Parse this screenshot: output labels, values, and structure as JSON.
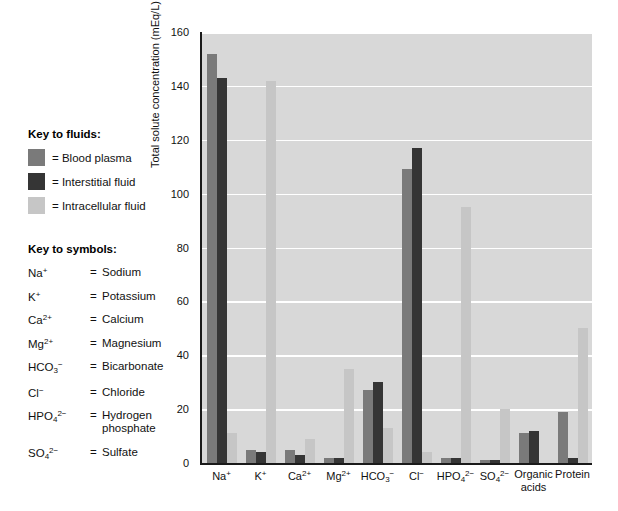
{
  "key_fluids": {
    "title": "Key to fluids:",
    "items": [
      {
        "label": "= Blood plasma",
        "color": "#7a7a7a"
      },
      {
        "label": "= Interstitial fluid",
        "color": "#353535"
      },
      {
        "label": "= Intracellular fluid",
        "color": "#c6c6c6"
      }
    ]
  },
  "key_symbols": {
    "title": "Key to symbols:",
    "items": [
      {
        "formula_html": "Na<sup>+</sup>",
        "eq": "=",
        "name": "Sodium",
        "name2": ""
      },
      {
        "formula_html": "K<sup>+</sup>",
        "eq": "=",
        "name": "Potassium",
        "name2": ""
      },
      {
        "formula_html": "Ca<sup>2+</sup>",
        "eq": "=",
        "name": "Calcium",
        "name2": ""
      },
      {
        "formula_html": "Mg<sup>2+</sup>",
        "eq": "=",
        "name": "Magnesium",
        "name2": ""
      },
      {
        "formula_html": "HCO<sub>3</sub><sup>&#8722;</sup>",
        "eq": "=",
        "name": "Bicarbonate",
        "name2": ""
      },
      {
        "formula_html": "Cl<sup>&#8722;</sup>",
        "eq": "=",
        "name": "Chloride",
        "name2": ""
      },
      {
        "formula_html": "HPO<sub>4</sub><sup>2&#8722;</sup>",
        "eq": "=",
        "name": "Hydrogen",
        "name2": "phosphate"
      },
      {
        "formula_html": "SO<sub>4</sub><sup>2&#8722;</sup>",
        "eq": "=",
        "name": "Sulfate",
        "name2": ""
      }
    ]
  },
  "chart_data": {
    "type": "bar",
    "title": "",
    "xlabel": "",
    "ylabel": "Total solute concentration (mEq/L)",
    "ylim": [
      0,
      160
    ],
    "yticks": [
      0,
      20,
      40,
      60,
      80,
      100,
      120,
      140,
      160
    ],
    "grid": true,
    "legend_position": "left-external",
    "categories": [
      "Na+",
      "K+",
      "Ca2+",
      "Mg2+",
      "HCO3-",
      "Cl-",
      "HPO4 2-",
      "SO4 2-",
      "Organic acids",
      "Protein"
    ],
    "category_labels_html": [
      "Na<sup>+</sup>",
      "K<sup>+</sup>",
      "Ca<sup>2+</sup>",
      "Mg<sup>2+</sup>",
      "HCO<sub>3</sub><sup>&#8722;</sup>",
      "Cl<sup>&#8722;</sup>",
      "HPO<sub>4</sub><sup>2&#8722;</sup>",
      "SO<sub>4</sub><sup>2&#8722;</sup>",
      "Organic|acids",
      "Protein"
    ],
    "series": [
      {
        "name": "Blood plasma",
        "color": "#7a7a7a",
        "values": [
          152,
          5,
          5,
          2,
          27,
          109,
          2,
          1,
          11,
          19
        ]
      },
      {
        "name": "Interstitial fluid",
        "color": "#353535",
        "values": [
          143,
          4,
          3,
          2,
          30,
          117,
          2,
          1,
          12,
          2
        ]
      },
      {
        "name": "Intracellular fluid",
        "color": "#c6c6c6",
        "values": [
          11,
          142,
          9,
          35,
          13,
          4,
          95,
          20,
          0,
          50
        ]
      }
    ]
  }
}
